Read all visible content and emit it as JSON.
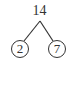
{
  "diagram": {
    "type": "factor-tree",
    "root": {
      "value": "14"
    },
    "children": [
      {
        "value": "2",
        "circled": true
      },
      {
        "value": "7",
        "circled": true
      }
    ],
    "colors": {
      "stroke": "#333333",
      "text": "#333333",
      "background": "#ffffff"
    }
  }
}
